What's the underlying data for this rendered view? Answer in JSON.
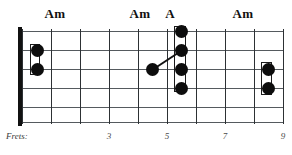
{
  "diagram": {
    "type": "guitar-fretboard-chord-diagram",
    "string_count": 6,
    "fret_count": 9,
    "nut_visible": true
  },
  "chord_labels": [
    {
      "name": "chord-label-am-1",
      "text": "Am",
      "x": 55
    },
    {
      "name": "chord-label-am-2",
      "text": "Am",
      "x": 140
    },
    {
      "name": "chord-label-a",
      "text": "A",
      "x": 170
    },
    {
      "name": "chord-label-am-3",
      "text": "Am",
      "x": 243
    }
  ],
  "fret_axis": {
    "caption": "Frets:",
    "numbers": [
      {
        "label": "3",
        "fret": 3,
        "x": 109
      },
      {
        "label": "5",
        "fret": 5,
        "x": 167
      },
      {
        "label": "7",
        "fret": 7,
        "x": 225
      },
      {
        "label": "9",
        "fret": 9,
        "x": 283
      }
    ]
  },
  "geometry": {
    "board_left": 22,
    "board_top": 29,
    "board_width": 262,
    "board_height": 95,
    "string_y": [
      2,
      21,
      40,
      59,
      78,
      93
    ],
    "fret_x": [
      0,
      29,
      58,
      87,
      116,
      145,
      174,
      203,
      232,
      261
    ]
  },
  "dots": [
    {
      "name": "dot-fret1-string2",
      "fret": 1,
      "string": 2,
      "x": 15,
      "y": 21
    },
    {
      "name": "dot-fret1-string3",
      "fret": 1,
      "string": 3,
      "x": 15,
      "y": 40
    },
    {
      "name": "dot-fret4-string3",
      "fret": 4,
      "string": 3,
      "x": 130,
      "y": 40
    },
    {
      "name": "dot-fret5-string1",
      "fret": 5,
      "string": 1,
      "x": 159,
      "y": 2
    },
    {
      "name": "dot-fret5-string2",
      "fret": 5,
      "string": 2,
      "x": 159,
      "y": 21
    },
    {
      "name": "dot-fret5-string3",
      "fret": 5,
      "string": 3,
      "x": 159,
      "y": 40
    },
    {
      "name": "dot-fret5-string4",
      "fret": 5,
      "string": 4,
      "x": 159,
      "y": 59
    },
    {
      "name": "dot-fret8-string3",
      "fret": 8,
      "string": 3,
      "x": 246,
      "y": 40
    },
    {
      "name": "dot-fret8-string4",
      "fret": 8,
      "string": 4,
      "x": 246,
      "y": 59
    }
  ],
  "barres": [
    {
      "name": "barre-bracket-fret1",
      "x": 8,
      "y": 15,
      "width": 10,
      "height": 31
    },
    {
      "name": "barre-bracket-fret5",
      "x": 152,
      "y": -3,
      "width": 12,
      "height": 66
    },
    {
      "name": "barre-bracket-fret8",
      "x": 239,
      "y": 33,
      "width": 11,
      "height": 33
    }
  ],
  "connectors": [
    {
      "name": "connector-fret4-to-fret5",
      "x1": 130,
      "y1": 40,
      "x2": 159,
      "y2": 21
    }
  ],
  "colors": {
    "dot": "#0d0d0d",
    "string": "#555a5e",
    "fret": "#2d3134",
    "nut": "#111111",
    "label": "#111111",
    "axis_text": "#4a4a4a",
    "background": "#ffffff"
  }
}
